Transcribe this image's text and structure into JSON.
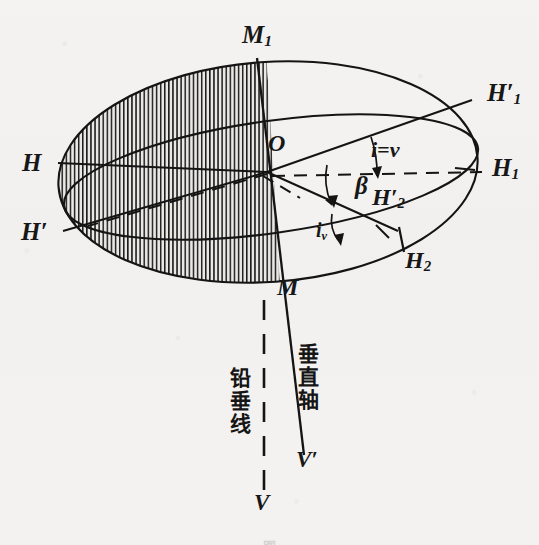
{
  "figure": {
    "kind": "geometric-diagram",
    "background_color": "#f3f2f0",
    "ink_color": "#171717"
  },
  "labels": {
    "m1": {
      "text": "M",
      "sub": "1",
      "prime": ""
    },
    "m": {
      "text": "M",
      "sub": "",
      "prime": ""
    },
    "o": {
      "text": "O",
      "sub": "",
      "prime": ""
    },
    "h": {
      "text": "H",
      "sub": "",
      "prime": ""
    },
    "hp": {
      "text": "H",
      "sub": "",
      "prime": "′"
    },
    "h1": {
      "text": "H",
      "sub": "1",
      "prime": ""
    },
    "h1p": {
      "text": "H",
      "sub": "1",
      "prime": "′"
    },
    "h2": {
      "text": "H",
      "sub": "2",
      "prime": ""
    },
    "h2p": {
      "text": "H",
      "sub": "2",
      "prime": "′"
    },
    "v": {
      "text": "V",
      "sub": "",
      "prime": ""
    },
    "vp": {
      "text": "V",
      "sub": "",
      "prime": "′"
    }
  },
  "angles": {
    "i_equals_v": "i=v",
    "beta": "β",
    "i_v_base": "i",
    "i_v_sub": "v"
  },
  "annotations": {
    "vertical_axis": "垂直轴",
    "plumb_line": "铅垂线"
  },
  "caption": {
    "text": "图"
  },
  "geometry": {
    "origin": {
      "x": 267,
      "y": 172
    },
    "ellipse_upper": {
      "cx": 268,
      "cy": 172,
      "rx": 210,
      "ry": 110,
      "rot": -4
    },
    "ellipse_lower": {
      "cx": 271,
      "cy": 177,
      "rx": 209,
      "ry": 56,
      "rot": -8
    },
    "m1_vertex": {
      "x": 258,
      "y": 62
    },
    "m_vertex": {
      "x": 281,
      "y": 281
    },
    "v_end": {
      "x": 304,
      "y": 452
    },
    "plumb_end": {
      "x": 264,
      "y": 492
    }
  }
}
